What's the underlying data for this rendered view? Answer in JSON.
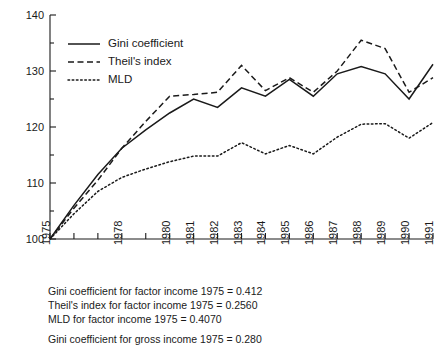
{
  "chart_data": {
    "type": "line",
    "title": "",
    "subtitle": "",
    "xlabel": "",
    "ylabel": "",
    "x": [
      1975,
      1976,
      1977,
      1978,
      1979,
      1980,
      1981,
      1982,
      1983,
      1984,
      1985,
      1986,
      1987,
      1988,
      1989,
      1990,
      1991
    ],
    "categories": [
      "1975",
      "1976",
      "1977",
      "1978",
      "1979",
      "1980",
      "1981",
      "1982",
      "1983",
      "1984",
      "1985",
      "1986",
      "1987",
      "1988",
      "1989",
      "1990",
      "1991"
    ],
    "tick_labels_shown": [
      "1975",
      "",
      "",
      "1978",
      "",
      "1980",
      "1981",
      "1982",
      "1983",
      "1984",
      "1985",
      "1986",
      "1987",
      "1988",
      "1989",
      "1990",
      "1991"
    ],
    "series": [
      {
        "name": "Gini coefficient",
        "style": "solid",
        "values": [
          100,
          106.0,
          111.5,
          116.2,
          119.5,
          122.5,
          125.0,
          123.5,
          127.0,
          125.5,
          128.5,
          125.5,
          129.5,
          130.8,
          129.5,
          125.0,
          131.2
        ]
      },
      {
        "name": "Theil's index",
        "style": "dashed",
        "values": [
          100,
          105.5,
          110.5,
          116.2,
          121.0,
          125.5,
          125.8,
          126.2,
          131.0,
          126.5,
          128.8,
          126.2,
          130.0,
          135.5,
          134.0,
          126.2,
          128.8
        ]
      },
      {
        "name": "MLD",
        "style": "dotted",
        "values": [
          100,
          104.5,
          108.5,
          111.0,
          112.5,
          113.8,
          114.8,
          114.8,
          117.2,
          115.2,
          116.7,
          115.2,
          118.2,
          120.5,
          120.6,
          118.0,
          120.8
        ]
      }
    ],
    "ylim": [
      100,
      140
    ],
    "yticks": [
      100,
      110,
      120,
      130,
      140
    ],
    "yticklabels": [
      "100",
      "110",
      "120",
      "130",
      "140"
    ],
    "yminorticks": [
      105,
      115,
      125,
      135
    ],
    "grid": false,
    "legend_position": "upper-left",
    "legend_entries": [
      "Gini coefficient",
      "Theil's index",
      "MLD"
    ]
  },
  "caption": {
    "lines": [
      "Gini coefficient for factor income 1975 = 0.412",
      "Theil's index for factor income 1975 = 0.2560",
      "MLD for factor income 1975 = 0.4070"
    ],
    "footnote": "Gini coefficient for gross income 1975 = 0.280"
  },
  "colors": {
    "ink": "#1a1a1a",
    "background": "#ffffff"
  }
}
